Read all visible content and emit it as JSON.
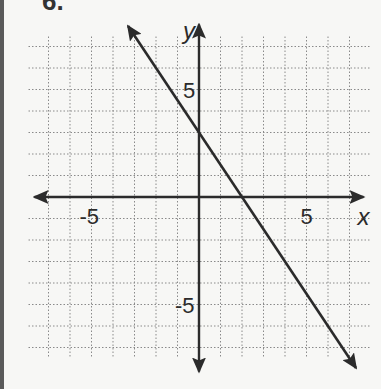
{
  "problem_number": "6.",
  "chart_data": {
    "type": "line",
    "title": "",
    "xlabel": "x",
    "ylabel": "y",
    "xlim": [
      -7,
      7
    ],
    "ylim": [
      -7,
      7
    ],
    "grid": true,
    "x_tick_labels": [
      {
        "value": -5,
        "label": "-5"
      },
      {
        "value": 5,
        "label": "5"
      }
    ],
    "y_tick_labels": [
      {
        "value": 5,
        "label": "5"
      },
      {
        "value": -5,
        "label": "-5"
      }
    ],
    "series": [
      {
        "name": "line",
        "equation": "y = -3/2 x + 3",
        "slope": -1.5,
        "intercept": 3,
        "points": [
          {
            "x": -3.3,
            "y": 7.95
          },
          {
            "x": 0,
            "y": 3
          },
          {
            "x": 2,
            "y": 0
          },
          {
            "x": 7.3,
            "y": -7.95
          }
        ],
        "arrows": "both"
      }
    ]
  }
}
